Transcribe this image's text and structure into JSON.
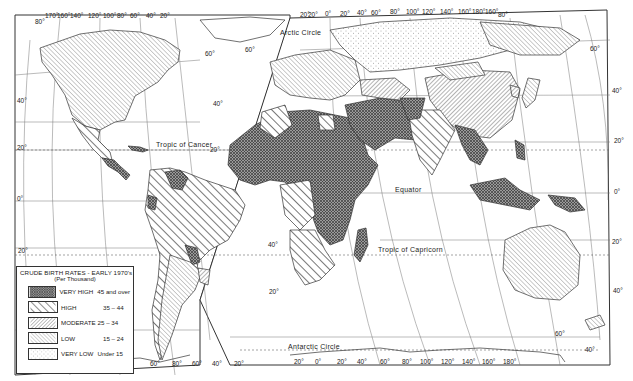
{
  "map": {
    "type": "choropleth world map",
    "projection": "interrupted oval (graticule at 20° intervals)",
    "labels": {
      "arctic_circle": "Arctic Circle",
      "tropic_of_cancer": "Tropic of Cancer",
      "equator": "Equator",
      "tropic_of_capricorn": "Tropic  of  Capricorn",
      "antarctic_circle": "Antarctic  Circle"
    },
    "top_longitudes_west": [
      "80°",
      "170°",
      "160°",
      "140°",
      "120°",
      "100°",
      "80°",
      "60°",
      "40°",
      "20°"
    ],
    "top_longitudes_east": [
      "20°",
      "20°",
      "0°",
      "20°",
      "40°",
      "60°",
      "80°",
      "100°",
      "120°",
      "140°",
      "160°",
      "180°",
      "160°",
      "80°"
    ],
    "bottom_longitudes_west": [
      "60°",
      "80°",
      "60°",
      "40°",
      "20°"
    ],
    "bottom_longitudes_east": [
      "20°",
      "0°",
      "20°",
      "40°",
      "60°",
      "80°",
      "100°",
      "120°",
      "140°",
      "160°",
      "180°"
    ],
    "left_latitudes": [
      "40°",
      "20°",
      "0°",
      "20°"
    ],
    "right_latitudes": [
      "60°",
      "40°",
      "20°",
      "0°",
      "20°",
      "40°"
    ],
    "interior_latitudes": [
      "60°",
      "40°",
      "20°",
      "60°",
      "40°",
      "20°",
      "40°",
      "60°"
    ]
  },
  "legend": {
    "title": "CRUDE BIRTH RATES - EARLY 1970's",
    "subtitle": "(Per Thousand)",
    "items": [
      {
        "label": "VERY HIGH",
        "range": "45 and over",
        "pattern": "crosshatch-dark"
      },
      {
        "label": "HIGH",
        "range": "35 – 44",
        "pattern": "wide-diagonal"
      },
      {
        "label": "MODERATE",
        "range": "25 – 34",
        "pattern": "fine-diagonal-reverse"
      },
      {
        "label": "LOW",
        "range": "15 – 24",
        "pattern": "fine-diagonal"
      },
      {
        "label": "VERY LOW",
        "range": "Under 15",
        "pattern": "dots"
      }
    ]
  },
  "colors": {
    "ink": "#2a2a2a",
    "paper": "#ffffff",
    "very_high_fill": "#8a8a8a"
  }
}
